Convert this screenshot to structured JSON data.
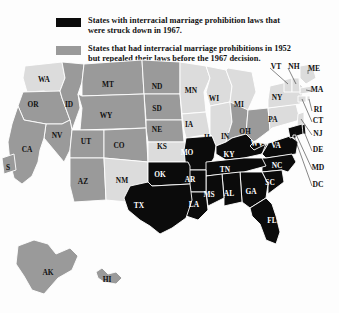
{
  "figure": {
    "kind": "thematic-choropleth-map",
    "background_color": "#fdfdfd"
  },
  "legend": {
    "items": [
      {
        "swatch_name": "black-swatch",
        "color": "#0b0b0b",
        "line1": "States with interracial marriage prohibition laws that",
        "line2": "were struck down in 1967."
      },
      {
        "swatch_name": "gray-swatch",
        "color": "#9a9a9a",
        "line1": "States that had interracial marriage prohibitions in 1952",
        "line2": "but repealed their laws before the 1967 decision."
      }
    ]
  },
  "map": {
    "colors": {
      "struck_down_1967": "#0b0b0b",
      "repealed_before_1967": "#9a9a9a",
      "no_prohibition": "#dcdcdc",
      "border": "#ffffff",
      "water": "#fdfdfd"
    },
    "categories": {
      "black": "struck_down_1967",
      "gray": "repealed_before_1967",
      "light": "no_prohibition"
    },
    "states": [
      {
        "code": "WA",
        "category": "light",
        "x": 44,
        "y": 22,
        "label_on": "light"
      },
      {
        "code": "OR",
        "category": "gray",
        "x": 33,
        "y": 47,
        "label_on": "light"
      },
      {
        "code": "ID",
        "category": "gray",
        "x": 69,
        "y": 47,
        "label_on": "light"
      },
      {
        "code": "MT",
        "category": "gray",
        "x": 108,
        "y": 27,
        "label_on": "light"
      },
      {
        "code": "ND",
        "category": "gray",
        "x": 157,
        "y": 29,
        "label_on": "light"
      },
      {
        "code": "SD",
        "category": "gray",
        "x": 157,
        "y": 51,
        "label_on": "light"
      },
      {
        "code": "NE",
        "category": "gray",
        "x": 157,
        "y": 72,
        "label_on": "light"
      },
      {
        "code": "WY",
        "category": "gray",
        "x": 106,
        "y": 58,
        "label_on": "light"
      },
      {
        "code": "NV",
        "category": "gray",
        "x": 57,
        "y": 78,
        "label_on": "light"
      },
      {
        "code": "UT",
        "category": "gray",
        "x": 86,
        "y": 84,
        "label_on": "light"
      },
      {
        "code": "CO",
        "category": "gray",
        "x": 119,
        "y": 88,
        "label_on": "light"
      },
      {
        "code": "CA",
        "category": "gray",
        "x": 27,
        "y": 92,
        "label_on": "light"
      },
      {
        "code": "AZ",
        "category": "gray",
        "x": 83,
        "y": 124,
        "label_on": "light"
      },
      {
        "code": "NM",
        "category": "light",
        "x": 122,
        "y": 123,
        "label_on": "light"
      },
      {
        "code": "KS",
        "category": "light",
        "x": 162,
        "y": 89,
        "label_on": "light"
      },
      {
        "code": "MN",
        "category": "light",
        "x": 191,
        "y": 33,
        "label_on": "light"
      },
      {
        "code": "WI",
        "category": "light",
        "x": 214,
        "y": 41,
        "label_on": "light"
      },
      {
        "code": "IA",
        "category": "light",
        "x": 189,
        "y": 67,
        "label_on": "light"
      },
      {
        "code": "MI",
        "category": "light",
        "x": 239,
        "y": 47,
        "label_on": "light"
      },
      {
        "code": "IL",
        "category": "light",
        "x": 208,
        "y": 80,
        "label_on": "light"
      },
      {
        "code": "IN",
        "category": "gray",
        "x": 225,
        "y": 79,
        "label_on": "light"
      },
      {
        "code": "OH",
        "category": "gray",
        "x": 245,
        "y": 74,
        "label_on": "light"
      },
      {
        "code": "PA",
        "category": "light",
        "x": 273,
        "y": 62,
        "label_on": "light"
      },
      {
        "code": "NY",
        "category": "light",
        "x": 277,
        "y": 40,
        "label_on": "light"
      },
      {
        "code": "MO",
        "category": "black",
        "x": 187,
        "y": 95,
        "label_on": "dark"
      },
      {
        "code": "KY",
        "category": "black",
        "x": 229,
        "y": 97,
        "label_on": "dark"
      },
      {
        "code": "WV",
        "category": "black",
        "x": 257,
        "y": 86,
        "label_on": "dark"
      },
      {
        "code": "VA",
        "category": "black",
        "x": 276,
        "y": 88,
        "label_on": "dark"
      },
      {
        "code": "NC",
        "category": "black",
        "x": 277,
        "y": 108,
        "label_on": "dark"
      },
      {
        "code": "TN",
        "category": "black",
        "x": 225,
        "y": 112,
        "label_on": "dark"
      },
      {
        "code": "SC",
        "category": "black",
        "x": 270,
        "y": 125,
        "label_on": "dark"
      },
      {
        "code": "GA",
        "category": "black",
        "x": 251,
        "y": 134,
        "label_on": "dark"
      },
      {
        "code": "AL",
        "category": "black",
        "x": 229,
        "y": 136,
        "label_on": "dark"
      },
      {
        "code": "MS",
        "category": "black",
        "x": 209,
        "y": 137,
        "label_on": "dark"
      },
      {
        "code": "AR",
        "category": "black",
        "x": 190,
        "y": 122,
        "label_on": "dark"
      },
      {
        "code": "LA",
        "category": "black",
        "x": 194,
        "y": 147,
        "label_on": "dark"
      },
      {
        "code": "OK",
        "category": "black",
        "x": 160,
        "y": 117,
        "label_on": "dark"
      },
      {
        "code": "TX",
        "category": "black",
        "x": 139,
        "y": 148,
        "label_on": "dark"
      },
      {
        "code": "FL",
        "category": "black",
        "x": 272,
        "y": 163,
        "label_on": "dark"
      },
      {
        "code": "AK",
        "category": "gray",
        "x": 48,
        "y": 215,
        "label_on": "light"
      },
      {
        "code": "HI",
        "category": "gray",
        "x": 107,
        "y": 222,
        "label_on": "light"
      },
      {
        "code": "S",
        "category": "gray",
        "x": 8,
        "y": 110,
        "label_on": "light"
      }
    ],
    "callout_labels": [
      {
        "code": "VT",
        "x": 276,
        "y": 9
      },
      {
        "code": "NH",
        "x": 294,
        "y": 9
      },
      {
        "code": "ME",
        "x": 314,
        "y": 11
      },
      {
        "code": "MA",
        "x": 317,
        "y": 32
      },
      {
        "code": "RI",
        "x": 318,
        "y": 52
      },
      {
        "code": "CT",
        "x": 318,
        "y": 63
      },
      {
        "code": "NJ",
        "x": 318,
        "y": 76
      },
      {
        "code": "DE",
        "x": 318,
        "y": 92
      },
      {
        "code": "MD",
        "x": 318,
        "y": 110
      },
      {
        "code": "DC",
        "x": 318,
        "y": 127
      }
    ]
  }
}
